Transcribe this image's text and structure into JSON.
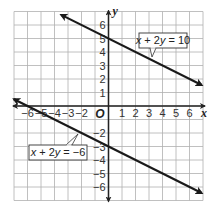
{
  "chart_data": {
    "type": "line",
    "title": "",
    "xlabel": "x",
    "ylabel": "y",
    "origin_label": "O",
    "xlim": [
      -7,
      7
    ],
    "ylim": [
      -7,
      7
    ],
    "grid": true,
    "x_ticks": [
      -6,
      -5,
      -4,
      -3,
      -2,
      1,
      2,
      3,
      4,
      5,
      6
    ],
    "y_ticks": [
      6,
      5,
      4,
      3,
      2,
      1,
      -2,
      -3,
      -4,
      -5,
      -6
    ],
    "x_tick_labels": [
      "−6",
      "−5",
      "−4",
      "−3",
      "−2",
      "1",
      "2",
      "3",
      "4",
      "5",
      "6"
    ],
    "y_tick_labels": [
      "6",
      "5",
      "4",
      "3",
      "2",
      "1",
      "−2",
      "−3",
      "−4",
      "−5",
      "−6"
    ],
    "series": [
      {
        "name": "x + 2y = 10",
        "equation": "x + 2y = 10",
        "slope": -0.5,
        "y_intercept": 5,
        "x": [
          -3.5,
          6.9
        ],
        "y": [
          6.75,
          1.55
        ],
        "arrows": "both"
      },
      {
        "name": "x + 2y = −6",
        "equation": "x + 2y = −6",
        "slope": -0.5,
        "y_intercept": -3,
        "x": [
          -7,
          6.9
        ],
        "y": [
          0.5,
          -6.45
        ],
        "arrows": "both"
      }
    ],
    "annotations": [
      {
        "text": "x + 2y = 10",
        "points_to": [
          3.2,
          3.4
        ]
      },
      {
        "text": "x + 2y = −6",
        "points_to": [
          -2.3,
          -2
        ]
      }
    ]
  },
  "colors": {
    "grid": "#b0b0b0",
    "axis": "#222222",
    "line": "#1a1a1a",
    "label_border": "#333333"
  },
  "labels": {
    "upper_equation": "x + 2y = 10",
    "lower_equation": "x + 2y = −6"
  }
}
